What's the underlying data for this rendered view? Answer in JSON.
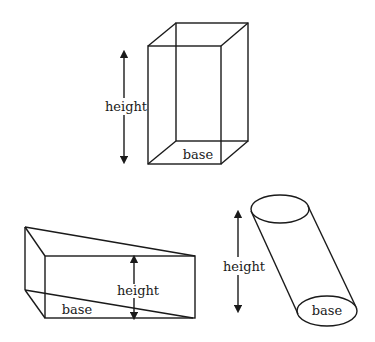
{
  "diagram": {
    "title": "",
    "shapes": [
      {
        "name": "rectangular-prism",
        "labels": {
          "height": "height",
          "base": "base"
        }
      },
      {
        "name": "triangular-prism",
        "labels": {
          "height": "height",
          "base": "base"
        }
      },
      {
        "name": "oblique-cylinder",
        "labels": {
          "height": "height",
          "base": "base"
        }
      }
    ],
    "colors": {
      "stroke": "#1a1a1a",
      "background": "#ffffff"
    }
  }
}
